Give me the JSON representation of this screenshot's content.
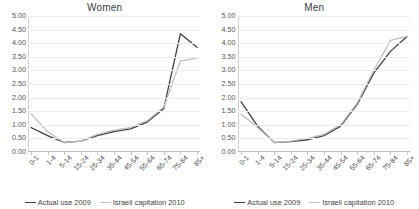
{
  "figure": {
    "background": "#ffffff",
    "series_colors": {
      "actual_use_2009": "#3f3f3f",
      "israeli_capitation_2010": "#bfbfbf"
    }
  },
  "legend": {
    "entries": [
      {
        "label": "Actual use 2009",
        "color": "#3f3f3f"
      },
      {
        "label": "Israeli capitation 2010",
        "color": "#bfbfbf"
      }
    ]
  },
  "axis": {
    "y_ticks": [
      "0.00",
      "0.50",
      "1.00",
      "1.50",
      "2.00",
      "2.50",
      "3.00",
      "3.50",
      "4.00",
      "4.50",
      "5.00"
    ],
    "x_categories": [
      "0-1",
      "1-4",
      "5-14",
      "15-24",
      "25-34",
      "35-44",
      "45-54",
      "55-64",
      "65-74",
      "75-84",
      "85+"
    ]
  },
  "chart_data": [
    {
      "type": "line",
      "title": "Women",
      "xlabel": "",
      "ylabel": "",
      "ylim": [
        0,
        5
      ],
      "ytick_step": 0.5,
      "grid": true,
      "legend_position": "bottom",
      "categories": [
        "0-1",
        "1-4",
        "5-14",
        "15-24",
        "25-34",
        "35-44",
        "45-54",
        "55-64",
        "65-74",
        "75-84",
        "85+"
      ],
      "series": [
        {
          "name": "Actual use 2009",
          "color": "#3f3f3f",
          "values": [
            0.9,
            0.6,
            0.35,
            0.4,
            0.6,
            0.75,
            0.85,
            1.1,
            1.6,
            4.35,
            3.85
          ]
        },
        {
          "name": "Israeli capitation 2010",
          "color": "#bfbfbf",
          "values": [
            1.4,
            0.75,
            0.35,
            0.4,
            0.65,
            0.8,
            0.9,
            1.15,
            1.65,
            3.35,
            3.45
          ]
        }
      ]
    },
    {
      "type": "line",
      "title": "Men",
      "xlabel": "",
      "ylabel": "",
      "ylim": [
        0,
        5
      ],
      "ytick_step": 0.5,
      "grid": true,
      "legend_position": "bottom",
      "categories": [
        "0-1",
        "1-4",
        "5-14",
        "15-24",
        "25-34",
        "35-44",
        "45-54",
        "55-64",
        "65-74",
        "75-84",
        "85+"
      ],
      "series": [
        {
          "name": "Actual use 2009",
          "color": "#3f3f3f",
          "values": [
            1.85,
            0.95,
            0.35,
            0.38,
            0.45,
            0.6,
            0.95,
            1.75,
            2.9,
            3.7,
            4.25
          ]
        },
        {
          "name": "Israeli capitation 2010",
          "color": "#bfbfbf",
          "values": [
            1.4,
            0.9,
            0.35,
            0.4,
            0.5,
            0.65,
            1.0,
            1.8,
            3.0,
            4.1,
            4.25
          ]
        }
      ]
    }
  ]
}
